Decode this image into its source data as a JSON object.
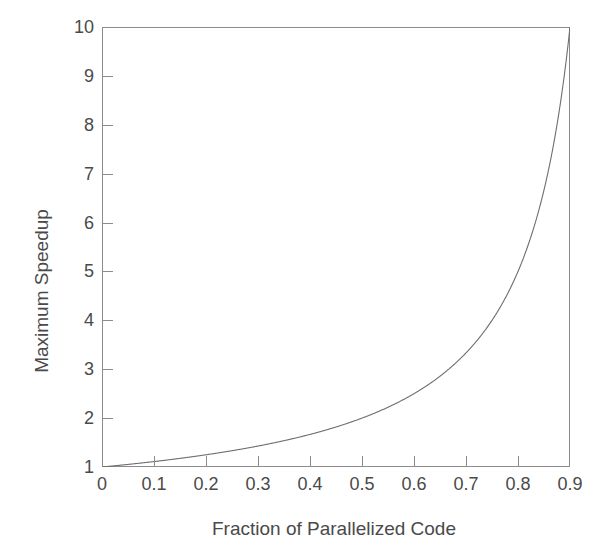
{
  "chart_data": {
    "type": "line",
    "title": "",
    "subtitle": "",
    "xlabel": "Fraction of Parallelized Code",
    "ylabel": "Maximum Speedup",
    "xlim": [
      0,
      0.9
    ],
    "ylim": [
      1,
      10
    ],
    "grid": false,
    "legend": null,
    "legend_position": "none",
    "annotations": [],
    "line_color": "#6e6e6e",
    "frame_color": "#8c8c8c",
    "text_color": "#4a4a4a",
    "background_color": "#ffffff",
    "xticks": [
      0,
      0.1,
      0.2,
      0.3,
      0.4,
      0.5,
      0.6,
      0.7,
      0.8,
      0.9
    ],
    "xticklabels": [
      "0",
      "0.1",
      "0.2",
      "0.3",
      "0.4",
      "0.5",
      "0.6",
      "0.7",
      "0.8",
      "0.9"
    ],
    "yticks": [
      1,
      2,
      3,
      4,
      5,
      6,
      7,
      8,
      9,
      10
    ],
    "yticklabels": [
      "1",
      "2",
      "3",
      "4",
      "5",
      "6",
      "7",
      "8",
      "9",
      "10"
    ],
    "tick_direction": "in",
    "formula": "S = 1 / (1 - p)",
    "series": [
      {
        "name": "Maximum Speedup",
        "x": [
          0.0,
          0.05,
          0.1,
          0.15,
          0.2,
          0.25,
          0.3,
          0.35,
          0.4,
          0.45,
          0.5,
          0.55,
          0.6,
          0.65,
          0.7,
          0.75,
          0.8,
          0.82,
          0.84,
          0.86,
          0.88,
          0.89,
          0.895,
          0.9
        ],
        "values": [
          1.0,
          1.05,
          1.11,
          1.18,
          1.25,
          1.33,
          1.43,
          1.54,
          1.67,
          1.82,
          2.0,
          2.22,
          2.5,
          2.86,
          3.33,
          4.0,
          5.0,
          5.56,
          6.25,
          7.14,
          8.33,
          9.09,
          9.52,
          10.0
        ]
      }
    ]
  },
  "axis": {
    "x_title": "Fraction of Parallelized Code",
    "y_title": "Maximum Speedup"
  }
}
